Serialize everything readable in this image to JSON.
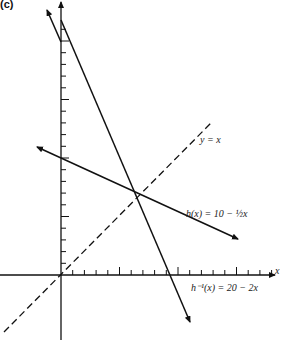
{
  "figure": {
    "panel_label": "(c)",
    "axis_x_label": "x",
    "labels": {
      "identity": "y = x",
      "h": "h(x) = 10 − ½x",
      "h_inv": "h⁻¹(x) = 20 − 2x"
    }
  },
  "chart_data": {
    "type": "line",
    "title": "",
    "xlabel": "x",
    "ylabel": "",
    "xlim": [
      -5,
      19
    ],
    "ylim": [
      -6,
      23
    ],
    "grid": false,
    "ticks": {
      "x_step": 1,
      "y_step": 1,
      "long_ticks_every": 5
    },
    "series": [
      {
        "name": "h(x) = 10 − ½x",
        "style": "solid",
        "points": [
          [
            -2,
            11
          ],
          [
            8,
            6
          ],
          [
            18,
            -1
          ]
        ]
      },
      {
        "name": "h⁻¹(x) = 20 − 2x",
        "style": "solid",
        "points": [
          [
            0,
            20
          ],
          [
            10,
            0
          ],
          [
            12,
            -4
          ]
        ]
      },
      {
        "name": "y = x",
        "style": "dashed",
        "points": [
          [
            -5,
            -5
          ],
          [
            13,
            13
          ]
        ]
      }
    ],
    "annotations": [
      {
        "text": "y = x",
        "x": 13,
        "y": 12
      },
      {
        "text": "h(x) = 10 − ½x",
        "x": 11,
        "y": 7
      },
      {
        "text": "h⁻¹(x) = 20 − 2x",
        "x": 12,
        "y": -2
      }
    ],
    "intersection": [
      6.67,
      6.67
    ]
  }
}
